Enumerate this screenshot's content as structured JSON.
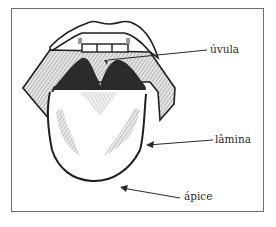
{
  "diagram": {
    "labels": [
      {
        "id": "uvula",
        "text": "úvula"
      },
      {
        "id": "lamina",
        "text": "lâmina"
      },
      {
        "id": "apice",
        "text": "ápice"
      }
    ],
    "colors": {
      "ink": "#1e1e1e",
      "shading": "#8a8a8a",
      "dark_fill": "#2b2b2b",
      "frame": "#6e6e6e",
      "background": "#ffffff"
    }
  }
}
